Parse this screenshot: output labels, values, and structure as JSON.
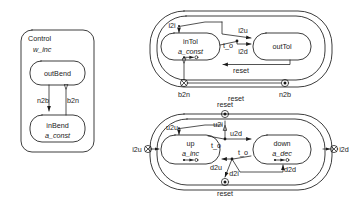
{
  "figure": {
    "type": "statechart-diagram",
    "background": "#ffffff",
    "ink_color": "#1a1a1a"
  },
  "panels": {
    "control": {
      "title": "Control",
      "action": "w_inc",
      "states": [
        {
          "name": "outBend",
          "action": ""
        },
        {
          "name": "inBend",
          "action": "a_const"
        }
      ],
      "transitions": [
        {
          "label": "n2b",
          "from": "outBend",
          "to": "inBend"
        },
        {
          "label": "b2n",
          "from": "inBend",
          "to": "outBend"
        }
      ]
    },
    "outbend": {
      "title": "outBend",
      "states": [
        {
          "name": "inTol",
          "action": "a_const"
        },
        {
          "name": "outTol",
          "action": ""
        }
      ],
      "transitions": [
        {
          "label": "i2i"
        },
        {
          "label": "i2u"
        },
        {
          "label": "i2d"
        },
        {
          "label": "t_o"
        },
        {
          "label": "reset"
        }
      ],
      "ports": [
        {
          "label": "b2n",
          "kind": "crossed-circle-port"
        },
        {
          "label": "n2b",
          "kind": "dot-circle-port"
        }
      ],
      "outer_label": "reset"
    },
    "outtol": {
      "title": "outTol",
      "states": [
        {
          "name": "up",
          "action": "a_inc"
        },
        {
          "name": "down",
          "action": "a_dec"
        }
      ],
      "transitions": [
        {
          "label": "u2u"
        },
        {
          "label": "u2i"
        },
        {
          "label": "u2d"
        },
        {
          "label": "t_o"
        },
        {
          "label": "t_o"
        },
        {
          "label": "d2u"
        },
        {
          "label": "d2i"
        },
        {
          "label": "d2d"
        }
      ],
      "ports": [
        {
          "label": "reset",
          "kind": "dot-circle-port",
          "position": "top"
        },
        {
          "label": "reset",
          "kind": "dot-circle-port",
          "position": "bottom"
        },
        {
          "label": "i2u",
          "kind": "crossed-circle-port",
          "position": "left"
        },
        {
          "label": "i2d",
          "kind": "crossed-circle-port",
          "position": "right"
        }
      ]
    }
  }
}
